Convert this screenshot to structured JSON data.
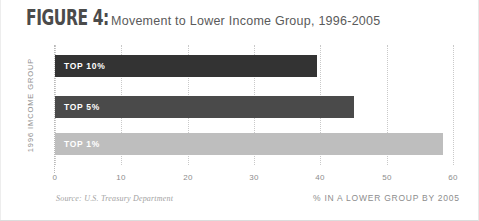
{
  "figure": {
    "number_label": "FIGURE 4:",
    "title": "Movement to Lower Income Group, 1996-2005",
    "source_note": "Source: U.S. Treasury Department"
  },
  "chart_data": {
    "type": "bar",
    "orientation": "horizontal",
    "title": "Movement to Lower Income Group, 1996-2005",
    "categories": [
      "TOP 10%",
      "TOP 5%",
      "TOP 1%"
    ],
    "values": [
      39.5,
      45,
      58.5
    ],
    "series": [
      {
        "name": "% in a lower group by 2005",
        "values": [
          39.5,
          45,
          58.5
        ]
      }
    ],
    "bar_colors": [
      "#333333",
      "#4a4a4a",
      "#bebebe"
    ],
    "xlabel": "% IN A LOWER GROUP BY 2005",
    "ylabel": "1996 IMCOME GROUP",
    "xlim": [
      0,
      60
    ],
    "xticks": [
      "0",
      "10",
      "20",
      "30",
      "40",
      "50",
      "60"
    ],
    "xtick_values": [
      0,
      10,
      20,
      30,
      40,
      50,
      60
    ],
    "grid": "vertical-dotted",
    "legend": "none"
  },
  "axes": {
    "x_title": "% IN A LOWER GROUP BY 2005",
    "y_title": "1996 IMCOME GROUP",
    "tick_0": "0",
    "tick_10": "10",
    "tick_20": "20",
    "tick_30": "30",
    "tick_40": "40",
    "tick_50": "50",
    "tick_60": "60"
  },
  "bars": [
    {
      "label": "TOP 10%",
      "value": 39.5,
      "color": "#333333"
    },
    {
      "label": "TOP 5%",
      "value": 45,
      "color": "#4a4a4a"
    },
    {
      "label": "TOP 1%",
      "value": 58.5,
      "color": "#bebebe"
    }
  ]
}
